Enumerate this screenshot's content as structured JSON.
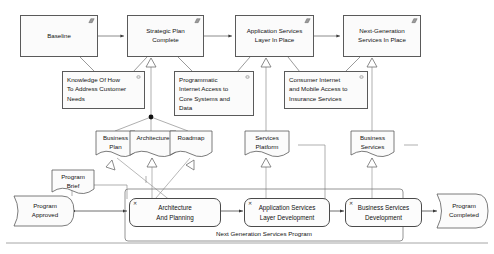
{
  "diagram": {
    "group_label": "Next Generation Services Program",
    "plateaus": [
      {
        "id": "baseline",
        "label": "Baseline",
        "icon": "plateau-icon"
      },
      {
        "id": "strategic-plan-complete",
        "label": "Strategic Plan\nComplete",
        "icon": "plateau-icon"
      },
      {
        "id": "application-services-layer-in-place",
        "label": "Application Services\nLayer In Place",
        "icon": "plateau-icon"
      },
      {
        "id": "next-generation-services-in-place",
        "label": "Next-Generation\nServices In Place",
        "icon": "plateau-icon"
      }
    ],
    "gaps": [
      {
        "id": "knowledge-of-how-to-address-customer-needs",
        "label": "Knowledge Of How\nTo Address Customer\nNeeds",
        "icon": "gap-icon"
      },
      {
        "id": "programmatic-internet-access",
        "label": "Programmatic\nInternet Access to\nCore Systems and\nData",
        "icon": "gap-icon"
      },
      {
        "id": "consumer-internet-and-mobile-access",
        "label": "Consumer Internet\nand Mobile Access to\nInsurance Services",
        "icon": "gap-icon"
      }
    ],
    "deliverables": [
      {
        "id": "business-plan",
        "label": "Business\nPlan"
      },
      {
        "id": "architecture",
        "label": "Architecture"
      },
      {
        "id": "roadmap",
        "label": "Roadmap"
      },
      {
        "id": "services-platform",
        "label": "Services\nPlatform"
      },
      {
        "id": "business-services",
        "label": "Business\nServices"
      },
      {
        "id": "program-brief",
        "label": "Program\nBrief"
      }
    ],
    "events": [
      {
        "id": "program-approved",
        "label": "Program\nApproved"
      },
      {
        "id": "program-completed",
        "label": "Program\nCompleted"
      }
    ],
    "work_packages": [
      {
        "id": "architecture-and-planning",
        "label": "Architecture\nAnd Planning"
      },
      {
        "id": "application-services-layer-development",
        "label": "Application Services\nLayer Development"
      },
      {
        "id": "business-services-development",
        "label": "Business Services\nDevelopment"
      }
    ],
    "colors": {
      "stroke": "#5a5a5a",
      "fill": "#fbfbfb",
      "text": "#111111",
      "connector": "#7a7a7a",
      "junction": "#111111"
    }
  }
}
